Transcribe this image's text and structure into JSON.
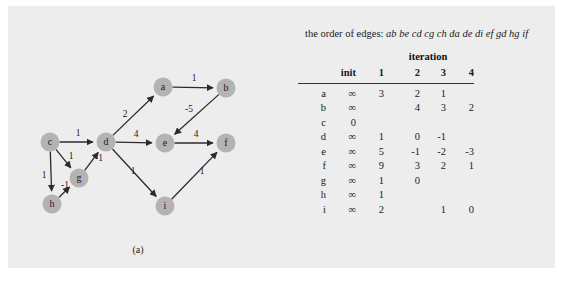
{
  "figure": {
    "background_color": "#ededed",
    "node_color": "#b3b3b3",
    "edge_color": "#2b2b2b"
  },
  "panel_a": {
    "caption": "(a)",
    "graph": {
      "nodes": [
        {
          "id": "a",
          "label": "a",
          "cx": 155,
          "cy": 81
        },
        {
          "id": "b",
          "label": "b",
          "cx": 218,
          "cy": 82
        },
        {
          "id": "c",
          "label": "c",
          "cx": 42,
          "cy": 136
        },
        {
          "id": "d",
          "label": "d",
          "cx": 98,
          "cy": 136
        },
        {
          "id": "e",
          "label": "e",
          "cx": 157,
          "cy": 137
        },
        {
          "id": "f",
          "label": "f",
          "cx": 218,
          "cy": 137
        },
        {
          "id": "g",
          "label": "g",
          "cx": 71,
          "cy": 172
        },
        {
          "id": "h",
          "label": "h",
          "cx": 44,
          "cy": 198
        },
        {
          "id": "i",
          "label": "i",
          "cx": 157,
          "cy": 200
        }
      ],
      "edges": [
        {
          "from": "a",
          "to": "b",
          "weight": "1",
          "lx": 186,
          "ly": 75
        },
        {
          "from": "b",
          "to": "e",
          "weight": "-5",
          "lx": 181,
          "ly": 106
        },
        {
          "from": "c",
          "to": "d",
          "weight": "1",
          "lx": 70,
          "ly": 130
        },
        {
          "from": "c",
          "to": "g",
          "weight": "1",
          "lx": 63,
          "ly": 153
        },
        {
          "from": "c",
          "to": "h",
          "weight": "1",
          "lx": 36,
          "ly": 172
        },
        {
          "from": "d",
          "to": "a",
          "weight": "2",
          "lx": 117,
          "ly": 111
        },
        {
          "from": "d",
          "to": "e",
          "weight": "4",
          "lx": 128,
          "ly": 131
        },
        {
          "from": "d",
          "to": "i",
          "weight": "1",
          "lx": 125,
          "ly": 168
        },
        {
          "from": "e",
          "to": "f",
          "weight": "4",
          "lx": 188,
          "ly": 131
        },
        {
          "from": "g",
          "to": "d",
          "weight": "-1",
          "lx": 91,
          "ly": 155
        },
        {
          "from": "h",
          "to": "g",
          "weight": "-1",
          "lx": 57,
          "ly": 182
        },
        {
          "from": "i",
          "to": "f",
          "weight": "1",
          "lx": 194,
          "ly": 168
        }
      ]
    }
  },
  "panel_b": {
    "caption": "(b)",
    "order_of_edges_label": "the order of edges:",
    "order_of_edges_sequence": "ab be cd cg ch da de di ef gd hg if",
    "iteration_header": "iteration",
    "columns": [
      "",
      "init",
      "1",
      "2",
      "3",
      "4"
    ],
    "rows": [
      {
        "vertex": "a",
        "init": "∞",
        "i1": "3",
        "i2": "2",
        "i3": "1",
        "i4": ""
      },
      {
        "vertex": "b",
        "init": "∞",
        "i1": "",
        "i2": "4",
        "i3": "3",
        "i4": "2"
      },
      {
        "vertex": "c",
        "init": "0",
        "i1": "",
        "i2": "",
        "i3": "",
        "i4": ""
      },
      {
        "vertex": "d",
        "init": "∞",
        "i1": "1",
        "i2": "0",
        "i3": "-1",
        "i4": ""
      },
      {
        "vertex": "e",
        "init": "∞",
        "i1": "5",
        "i2": "-1",
        "i3": "-2",
        "i4": "-3"
      },
      {
        "vertex": "f",
        "init": "∞",
        "i1": "9",
        "i2": "3",
        "i3": "2",
        "i4": "1"
      },
      {
        "vertex": "g",
        "init": "∞",
        "i1": "1",
        "i2": "0",
        "i3": "",
        "i4": ""
      },
      {
        "vertex": "h",
        "init": "∞",
        "i1": "1",
        "i2": "",
        "i3": "",
        "i4": ""
      },
      {
        "vertex": "i",
        "init": "∞",
        "i1": "2",
        "i2": "",
        "i3": "1",
        "i4": "0"
      }
    ]
  }
}
